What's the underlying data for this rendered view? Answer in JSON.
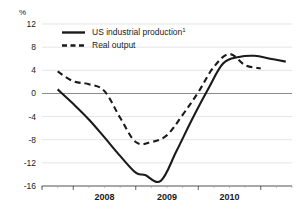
{
  "chart_data": {
    "type": "line",
    "title": "",
    "subtitle": "",
    "xlabel": "",
    "ylabel": "%",
    "unit_label": "%",
    "grid": true,
    "legend_position": "top-left",
    "xlim": [
      2007.5,
      2011.5
    ],
    "ylim": [
      -16,
      12
    ],
    "yticks": [
      12,
      8,
      4,
      0,
      -4,
      -8,
      -12,
      -16
    ],
    "ytick_labels": [
      "12",
      "8",
      "4",
      "0",
      "-4",
      "-8",
      "-12",
      "-16"
    ],
    "xticks_major": [
      2008,
      2009,
      2010
    ],
    "xtick_labels": [
      "2008",
      "2009",
      "2010"
    ],
    "xticks_minor_per_year": 4,
    "zero_line": 0,
    "footnote_marker": "1",
    "series": [
      {
        "name": "US industrial production",
        "label": "US industrial production¹",
        "style": "solid",
        "color": "#1a1a1a",
        "x": [
          2007.75,
          2008.0,
          2008.25,
          2008.5,
          2008.75,
          2009.0,
          2009.15,
          2009.4,
          2009.65,
          2009.9,
          2010.15,
          2010.4,
          2010.65,
          2010.9,
          2011.15,
          2011.4
        ],
        "values": [
          0.7,
          -1.8,
          -4.5,
          -7.6,
          -10.8,
          -13.7,
          -14.1,
          -15.1,
          -10.0,
          -4.5,
          0.6,
          5.2,
          6.3,
          6.5,
          6.0,
          5.5
        ]
      },
      {
        "name": "Real output",
        "label": "Real output",
        "style": "dashed",
        "color": "#1a1a1a",
        "x": [
          2007.75,
          2008.0,
          2008.25,
          2008.5,
          2008.75,
          2009.0,
          2009.25,
          2009.5,
          2009.75,
          2010.0,
          2010.25,
          2010.5,
          2010.75,
          2011.0
        ],
        "values": [
          3.8,
          2.1,
          1.6,
          0.4,
          -4.2,
          -8.4,
          -8.4,
          -7.2,
          -3.7,
          0.2,
          4.6,
          6.8,
          4.9,
          4.3
        ]
      }
    ]
  },
  "legend": {
    "entries": [
      {
        "label": "US industrial production",
        "superscript": "1",
        "style": "solid"
      },
      {
        "label": "Real output",
        "superscript": "",
        "style": "dashed"
      }
    ]
  },
  "axes": {
    "y_unit": "%",
    "y_labels": [
      "12",
      "8",
      "4",
      "0",
      "-4",
      "-8",
      "-12",
      "-16"
    ],
    "x_labels": [
      "2008",
      "2009",
      "2010"
    ]
  }
}
